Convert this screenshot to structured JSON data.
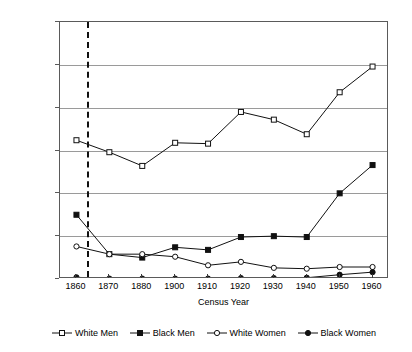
{
  "chart_data": {
    "type": "line",
    "title": "",
    "xlabel": "Census Year",
    "ylabel": "Percentage Employed as Craftsmen",
    "categories": [
      "1860",
      "1870",
      "1880",
      "1900",
      "1910",
      "1920",
      "1930",
      "1940",
      "1950",
      "1960"
    ],
    "ylim": [
      0,
      30
    ],
    "yticks": [
      0,
      5,
      10,
      15,
      20,
      25,
      30
    ],
    "ytick_labels": [
      "0",
      "5",
      "10",
      "15",
      "20",
      "25",
      "30"
    ],
    "grid": "horizontal",
    "legend_position": "below",
    "annotations": [
      {
        "type": "vertical-dashed-line",
        "at_category_fraction": 0.33,
        "label": ""
      }
    ],
    "series": [
      {
        "name": "White Men",
        "marker": "open-square",
        "values": [
          16.2,
          14.8,
          13.2,
          15.9,
          15.8,
          19.5,
          18.6,
          16.9,
          21.8,
          24.8
        ]
      },
      {
        "name": "Black Men",
        "marker": "filled-square",
        "values": [
          7.5,
          2.9,
          2.5,
          3.7,
          3.4,
          4.9,
          5.0,
          4.9,
          10.0,
          13.3
        ]
      },
      {
        "name": "White Women",
        "marker": "open-circle",
        "values": [
          3.8,
          2.9,
          2.9,
          2.6,
          1.6,
          2.0,
          1.3,
          1.2,
          1.4,
          1.4
        ]
      },
      {
        "name": "Black Women",
        "marker": "filled-circle",
        "values": [
          0.2,
          0.05,
          0.05,
          0.05,
          0.05,
          0.1,
          0.1,
          0.15,
          0.5,
          0.8
        ]
      }
    ]
  },
  "colors": {
    "ink": "#111111",
    "frame": "#5a5a5a",
    "grid": "#9a9a9a",
    "background": "#ffffff"
  }
}
